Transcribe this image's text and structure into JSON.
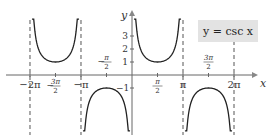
{
  "chart_data": {
    "type": "line",
    "title": "y = csc x",
    "function": "csc",
    "xlabel": "x",
    "ylabel": "y",
    "xlim": [
      -6.9,
      7.3
    ],
    "ylim": [
      -4,
      4.2
    ],
    "x_ticks": [
      {
        "value": -6.2832,
        "label": "−2π"
      },
      {
        "value": -4.7124,
        "label": "−3π/2"
      },
      {
        "value": -3.1416,
        "label": "−π"
      },
      {
        "value": -1.5708,
        "label": "−π/2"
      },
      {
        "value": 1.5708,
        "label": "π/2"
      },
      {
        "value": 3.1416,
        "label": "π"
      },
      {
        "value": 4.7124,
        "label": "3π/2"
      },
      {
        "value": 6.2832,
        "label": "2π"
      }
    ],
    "y_ticks": [
      {
        "value": 1,
        "label": "1"
      },
      {
        "value": 2,
        "label": "2"
      },
      {
        "value": 3,
        "label": "3"
      },
      {
        "value": -1,
        "label": "−1"
      }
    ],
    "asymptotes": [
      -6.2832,
      -3.1416,
      3.1416,
      6.2832
    ],
    "branches": [
      {
        "from": -6.2832,
        "to": -3.1416,
        "sign": 1,
        "vertex": [
          -4.7124,
          1
        ]
      },
      {
        "from": -3.1416,
        "to": 0,
        "sign": -1,
        "vertex": [
          -1.5708,
          -1
        ]
      },
      {
        "from": 0,
        "to": 3.1416,
        "sign": 1,
        "vertex": [
          1.5708,
          1
        ]
      },
      {
        "from": 3.1416,
        "to": 6.2832,
        "sign": -1,
        "vertex": [
          4.7124,
          -1
        ]
      }
    ],
    "grid": false,
    "legend": {
      "text": "y = csc x",
      "position": "top-right"
    }
  },
  "legend": {
    "text": "y = csc x"
  },
  "axes": {
    "x_label": "x",
    "y_label": "y"
  }
}
